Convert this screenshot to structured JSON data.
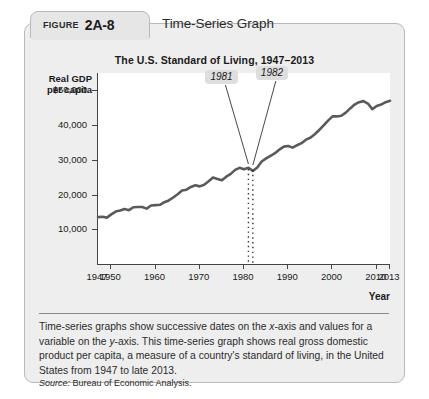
{
  "figure": {
    "label_word": "FIGURE",
    "number": "2A-8",
    "heading": "Time-Series Graph"
  },
  "caption": {
    "line1": "Time-series graphs show successive dates on the ",
    "x_axis_em": "x",
    "line2": "-axis and values for a variable on the ",
    "y_axis_em": "y",
    "line3": "-axis. This time-series graph shows real gross domestic product per capita, a measure of a country's standard of living, in the United States from 1947 to late 2013.",
    "source_word": "Source:",
    "source_text": " Bureau of Economic Analysis."
  },
  "chart_data": {
    "type": "line",
    "title": "The U.S. Standard of Living, 1947–2013",
    "ylabel": "Real GDP\nper capita",
    "ylabel_line1": "Real GDP",
    "ylabel_line2": "per capita",
    "xlabel": "Year",
    "xlim": [
      1947,
      2013
    ],
    "ylim": [
      0,
      55000
    ],
    "grid": false,
    "legend": "none",
    "line_color": "#5a5a5a",
    "y_ticks": [
      10000,
      20000,
      30000,
      40000,
      50000
    ],
    "y_tick_labels": [
      "10,000",
      "20,000",
      "30,000",
      "40,000",
      "$50,000"
    ],
    "x_ticks": [
      1947,
      1950,
      1960,
      1970,
      1980,
      1990,
      2000,
      2010,
      2013
    ],
    "x_tick_labels": [
      "1947",
      "1950",
      "1960",
      "1970",
      "1980",
      "1990",
      "2000",
      "2010",
      "2013"
    ],
    "annotations": [
      {
        "label": "1981",
        "x": 1981,
        "y": 28500
      },
      {
        "label": "1982",
        "x": 1982,
        "y": 28200
      }
    ],
    "x": [
      1947,
      1948,
      1949,
      1950,
      1951,
      1952,
      1953,
      1954,
      1955,
      1956,
      1957,
      1958,
      1959,
      1960,
      1961,
      1962,
      1963,
      1964,
      1965,
      1966,
      1967,
      1968,
      1969,
      1970,
      1971,
      1972,
      1973,
      1974,
      1975,
      1976,
      1977,
      1978,
      1979,
      1980,
      1981,
      1982,
      1983,
      1984,
      1985,
      1986,
      1987,
      1988,
      1989,
      1990,
      1991,
      1992,
      1993,
      1994,
      1995,
      1996,
      1997,
      1998,
      1999,
      2000,
      2001,
      2002,
      2003,
      2004,
      2005,
      2006,
      2007,
      2008,
      2009,
      2010,
      2011,
      2012,
      2013
    ],
    "values": [
      13500,
      13600,
      13350,
      14300,
      15100,
      15400,
      15850,
      15500,
      16350,
      16400,
      16400,
      15950,
      16850,
      16950,
      17050,
      17800,
      18300,
      19150,
      20100,
      21150,
      21400,
      22200,
      22650,
      22350,
      22800,
      23800,
      24900,
      24500,
      24100,
      25150,
      25950,
      27100,
      27700,
      27300,
      27700,
      26800,
      27800,
      29500,
      30400,
      31150,
      31900,
      32950,
      33800,
      34000,
      33500,
      34200,
      34800,
      35800,
      36350,
      37350,
      38600,
      39900,
      41300,
      42500,
      42500,
      42700,
      43600,
      44800,
      45900,
      46600,
      46900,
      46200,
      44600,
      45500,
      45900,
      46600,
      47000
    ]
  }
}
